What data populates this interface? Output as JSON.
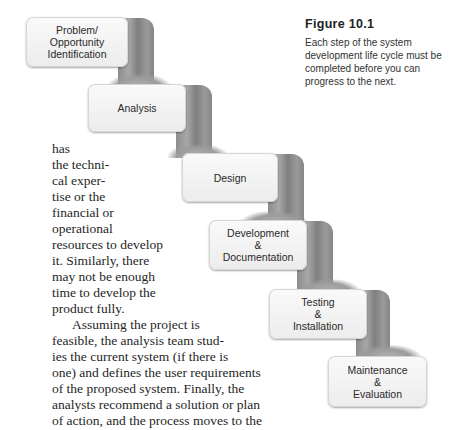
{
  "figure": {
    "title": "Figure 10.1",
    "caption": "Each step of the system development life cycle must be completed before you can progress to the next."
  },
  "steps": [
    {
      "label": "Problem/\nOpportunity\nIdentification"
    },
    {
      "label": "Analysis"
    },
    {
      "label": "Design"
    },
    {
      "label": "Development\n&\nDocumentation"
    },
    {
      "label": "Testing\n&\nInstallation"
    },
    {
      "label": "Maintenance\n&\nEvaluation"
    }
  ],
  "body_lines": [
    "has",
    "the techni-",
    "cal exper-",
    "tise or the",
    "financial or",
    "operational",
    "resources to develop",
    "it. Similarly, there",
    "may not be enough",
    "time to develop the",
    "product fully.",
    "Assuming the project is",
    "feasible, the analysis team stud-",
    "ies the current system (if there is",
    "one) and defines the user requirements",
    "of the proposed system. Finally, the",
    "analysts recommend a solution or plan",
    "of action, and the process moves to the"
  ]
}
